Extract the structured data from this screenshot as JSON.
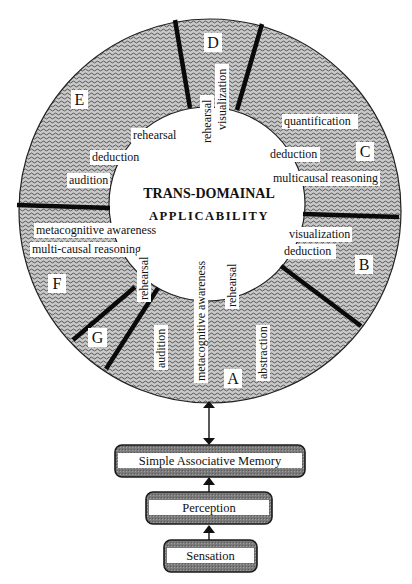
{
  "diagram": {
    "center_title": {
      "line1": "TRANS-DOMAINAL",
      "line2": "APPLICABILITY"
    },
    "sectors": [
      {
        "id": "A",
        "label": "A"
      },
      {
        "id": "B",
        "label": "B"
      },
      {
        "id": "C",
        "label": "C"
      },
      {
        "id": "D",
        "label": "D"
      },
      {
        "id": "E",
        "label": "E"
      },
      {
        "id": "F",
        "label": "F"
      },
      {
        "id": "G",
        "label": "G"
      }
    ],
    "sector_skills": {
      "A": [
        "metacognitive awareness",
        "rehearsal",
        "audition",
        "abstraction"
      ],
      "B": [
        "visualization",
        "deduction"
      ],
      "C": [
        "quantification",
        "deduction",
        "multicausal reasoning"
      ],
      "D": [
        "rehearsal",
        "visualization"
      ],
      "E": [
        "rehearsal",
        "deduction",
        "audition"
      ],
      "F": [
        "metacognitive awareness",
        "multi-causal reasoning"
      ],
      "G": [
        "rehearsal"
      ]
    },
    "hierarchy": [
      {
        "label": "Simple Associative Memory"
      },
      {
        "label": "Perception"
      },
      {
        "label": "Sensation"
      }
    ],
    "arrows": [
      {
        "from": "Simple Associative Memory",
        "to": "Trans-Domainal Applicability",
        "direction": "bidirectional"
      },
      {
        "from": "Perception",
        "to": "Simple Associative Memory",
        "direction": "up"
      },
      {
        "from": "Sensation",
        "to": "Perception",
        "direction": "up"
      }
    ],
    "colors": {
      "ring_fill": "#bdbdbd",
      "ring_wave": "#555555",
      "divider": "#0a0a0a",
      "label_bg": "#ffffff",
      "box_fill": "#8c8c8c"
    }
  }
}
